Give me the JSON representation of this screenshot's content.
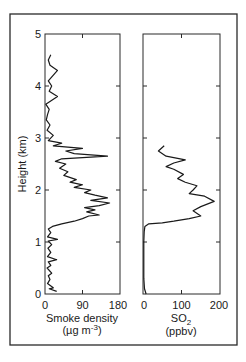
{
  "chart_data": [
    {
      "type": "line",
      "panel": "left",
      "title": "",
      "xlabel": "Smoke density",
      "xunits": "(µg m-3)",
      "ylabel": "Height (km)",
      "xlim": [
        0,
        180
      ],
      "ylim": [
        0,
        5
      ],
      "xticks": [
        0,
        90,
        180
      ],
      "yticks": [
        0,
        1,
        2,
        3,
        4,
        5
      ],
      "grid": false,
      "series": [
        {
          "name": "Smoke density",
          "points": [
            [
              28,
              0.05
            ],
            [
              10,
              0.1
            ],
            [
              20,
              0.12
            ],
            [
              6,
              0.2
            ],
            [
              12,
              0.28
            ],
            [
              8,
              0.35
            ],
            [
              16,
              0.4
            ],
            [
              5,
              0.5
            ],
            [
              14,
              0.55
            ],
            [
              8,
              0.62
            ],
            [
              28,
              0.66
            ],
            [
              6,
              0.72
            ],
            [
              14,
              0.8
            ],
            [
              7,
              0.88
            ],
            [
              16,
              0.95
            ],
            [
              8,
              1.02
            ],
            [
              30,
              1.05
            ],
            [
              6,
              1.1
            ],
            [
              14,
              1.18
            ],
            [
              8,
              1.25
            ],
            [
              18,
              1.3
            ],
            [
              40,
              1.35
            ],
            [
              70,
              1.4
            ],
            [
              90,
              1.45
            ],
            [
              105,
              1.5
            ],
            [
              130,
              1.52
            ],
            [
              100,
              1.58
            ],
            [
              120,
              1.62
            ],
            [
              95,
              1.66
            ],
            [
              130,
              1.7
            ],
            [
              155,
              1.75
            ],
            [
              110,
              1.8
            ],
            [
              150,
              1.85
            ],
            [
              120,
              1.9
            ],
            [
              95,
              1.95
            ],
            [
              110,
              2.0
            ],
            [
              70,
              2.05
            ],
            [
              90,
              2.1
            ],
            [
              60,
              2.15
            ],
            [
              75,
              2.2
            ],
            [
              45,
              2.28
            ],
            [
              55,
              2.35
            ],
            [
              35,
              2.42
            ],
            [
              50,
              2.5
            ],
            [
              25,
              2.55
            ],
            [
              40,
              2.6
            ],
            [
              150,
              2.65
            ],
            [
              70,
              2.7
            ],
            [
              50,
              2.75
            ],
            [
              90,
              2.8
            ],
            [
              20,
              2.85
            ],
            [
              40,
              2.9
            ],
            [
              8,
              2.95
            ],
            [
              20,
              3.05
            ],
            [
              5,
              3.15
            ],
            [
              12,
              3.25
            ],
            [
              3,
              3.35
            ],
            [
              6,
              3.45
            ],
            [
              10,
              3.55
            ],
            [
              2,
              3.65
            ],
            [
              30,
              3.8
            ],
            [
              10,
              3.9
            ],
            [
              16,
              4.0
            ],
            [
              8,
              4.1
            ],
            [
              30,
              4.3
            ],
            [
              12,
              4.4
            ],
            [
              8,
              4.5
            ],
            [
              14,
              4.6
            ]
          ]
        }
      ]
    },
    {
      "type": "line",
      "panel": "right",
      "title": "",
      "xlabel": "SO2",
      "xunits": "(ppbv)",
      "ylabel": "",
      "xlim": [
        0,
        200
      ],
      "ylim": [
        0,
        5
      ],
      "xticks": [
        0,
        100,
        200
      ],
      "yticks": [
        0,
        1,
        2,
        3,
        4,
        5
      ],
      "grid": false,
      "series": [
        {
          "name": "SO2",
          "points": [
            [
              8,
              0.0
            ],
            [
              4,
              0.1
            ],
            [
              2,
              0.3
            ],
            [
              2,
              0.6
            ],
            [
              2,
              1.0
            ],
            [
              3,
              1.2
            ],
            [
              5,
              1.3
            ],
            [
              15,
              1.35
            ],
            [
              50,
              1.37
            ],
            [
              80,
              1.4
            ],
            [
              120,
              1.45
            ],
            [
              150,
              1.5
            ],
            [
              130,
              1.6
            ],
            [
              150,
              1.68
            ],
            [
              185,
              1.78
            ],
            [
              160,
              1.88
            ],
            [
              120,
              1.93
            ],
            [
              130,
              2.0
            ],
            [
              140,
              2.08
            ],
            [
              110,
              2.15
            ],
            [
              90,
              2.22
            ],
            [
              105,
              2.3
            ],
            [
              80,
              2.4
            ],
            [
              60,
              2.45
            ],
            [
              80,
              2.52
            ],
            [
              110,
              2.58
            ],
            [
              60,
              2.65
            ],
            [
              40,
              2.75
            ],
            [
              55,
              2.85
            ]
          ]
        }
      ]
    }
  ],
  "labels": {
    "yaxis": "Height (km)",
    "left_xlabel_line1": "Smoke density",
    "left_xlabel_line2_prefix": "(µg m",
    "left_xlabel_line2_sup": "-3",
    "left_xlabel_line2_suffix": ")",
    "right_xlabel_line1_main": "SO",
    "right_xlabel_line1_sub": "2",
    "right_xlabel_line2": "(ppbv)",
    "yticks": [
      "0",
      "1",
      "2",
      "3",
      "4",
      "5"
    ],
    "left_xticks": [
      "0",
      "90",
      "180"
    ],
    "right_xticks": [
      "0",
      "100",
      "200"
    ]
  },
  "colors": {
    "line": "#1a1a1a",
    "frame": "#2a2a2a",
    "background": "#ffffff"
  }
}
